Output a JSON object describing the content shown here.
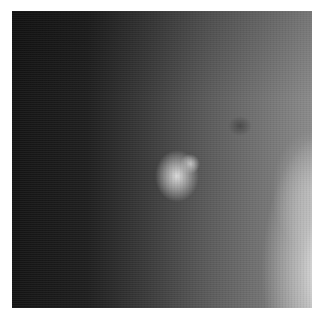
{
  "image": {
    "description": "Grayscale radiographic patch with a bright oval mass near the center and brighter tissue toward the lower right",
    "alt": "Grayscale medical scan patch"
  }
}
